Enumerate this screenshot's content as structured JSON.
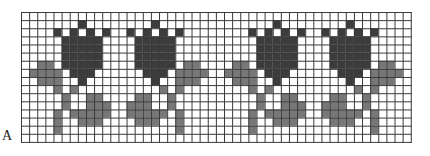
{
  "figure": {
    "label": "A",
    "grid": {
      "columns": 48,
      "rows": 16,
      "cell_px": 8.12
    },
    "colors": {
      "background": "#ffffff",
      "grid_line": "#3a3a3a",
      "flower": "#3c3c3c",
      "leaf": "#777777"
    },
    "motif_centers": [
      7,
      16,
      31,
      40
    ],
    "motif_mirrored": [
      false,
      true,
      false,
      true
    ],
    "motif_pattern": {
      "center_col": 7,
      "dark": [
        [
          1,
          7
        ],
        [
          2,
          4
        ],
        [
          2,
          6
        ],
        [
          2,
          8
        ],
        [
          2,
          10
        ],
        [
          3,
          5
        ],
        [
          3,
          6
        ],
        [
          3,
          7
        ],
        [
          3,
          8
        ],
        [
          3,
          9
        ],
        [
          4,
          5
        ],
        [
          4,
          6
        ],
        [
          4,
          7
        ],
        [
          4,
          8
        ],
        [
          4,
          9
        ],
        [
          5,
          5
        ],
        [
          5,
          6
        ],
        [
          5,
          7
        ],
        [
          5,
          8
        ],
        [
          5,
          9
        ],
        [
          6,
          5
        ],
        [
          6,
          6
        ],
        [
          6,
          7
        ],
        [
          6,
          8
        ],
        [
          6,
          9
        ],
        [
          7,
          6
        ],
        [
          7,
          7
        ],
        [
          7,
          8
        ],
        [
          8,
          7
        ]
      ],
      "mid": [
        [
          6,
          2
        ],
        [
          6,
          3
        ],
        [
          7,
          1
        ],
        [
          7,
          2
        ],
        [
          7,
          3
        ],
        [
          7,
          4
        ],
        [
          8,
          2
        ],
        [
          8,
          3
        ],
        [
          8,
          4
        ],
        [
          9,
          4
        ],
        [
          9,
          6
        ],
        [
          10,
          5
        ],
        [
          10,
          8
        ],
        [
          10,
          9
        ],
        [
          11,
          5
        ],
        [
          11,
          8
        ],
        [
          11,
          9
        ],
        [
          11,
          10
        ],
        [
          12,
          4
        ],
        [
          12,
          6
        ],
        [
          12,
          7
        ],
        [
          12,
          8
        ],
        [
          12,
          9
        ],
        [
          12,
          10
        ],
        [
          13,
          4
        ],
        [
          13,
          7
        ],
        [
          13,
          8
        ],
        [
          13,
          9
        ],
        [
          14,
          4
        ]
      ]
    }
  }
}
